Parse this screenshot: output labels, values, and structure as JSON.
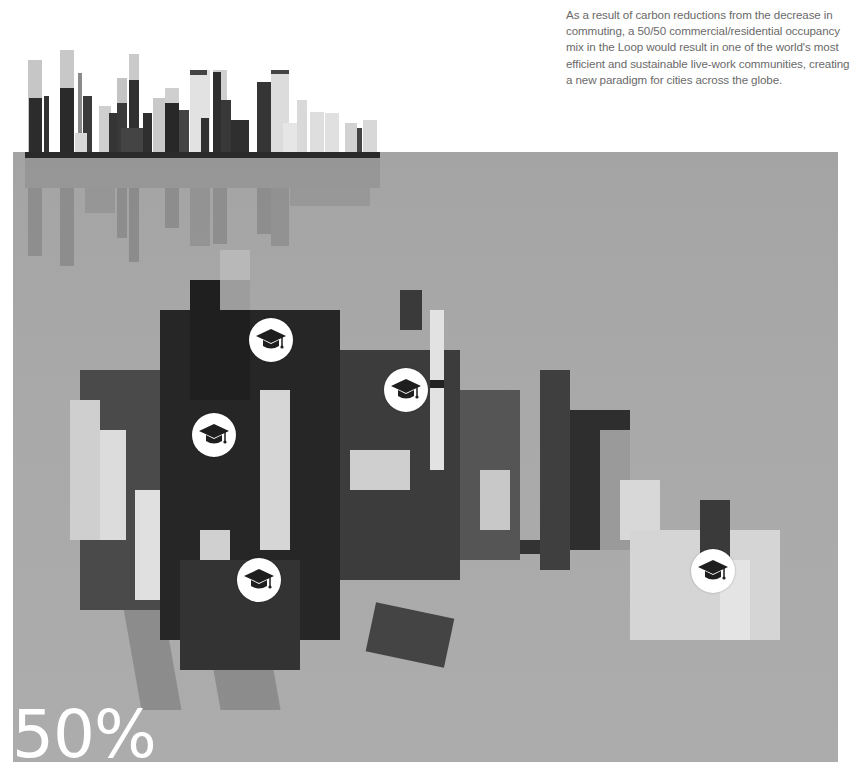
{
  "caption": {
    "text": "As a result of carbon reductions from the decrease in commuting, a 50/50 commercial/residential occupancy mix in the Loop would result in one of the world's most efficient and sustainable live-work communities, creating a new paradigm for cities across the globe."
  },
  "stat": {
    "value": "50%"
  },
  "markers": [
    {
      "icon": "graduation-cap-icon",
      "x": 249,
      "y": 318
    },
    {
      "icon": "graduation-cap-icon",
      "x": 384,
      "y": 368
    },
    {
      "icon": "graduation-cap-icon",
      "x": 192,
      "y": 413
    },
    {
      "icon": "graduation-cap-icon",
      "x": 237,
      "y": 558
    },
    {
      "icon": "graduation-cap-icon",
      "x": 691,
      "y": 549
    }
  ],
  "colors": {
    "plane": "#a8a8a8",
    "caption_text": "#6a6a6a",
    "stat_text": "#ffffff",
    "marker_bg": "#ffffff",
    "marker_icon": "#1e1e1e"
  }
}
